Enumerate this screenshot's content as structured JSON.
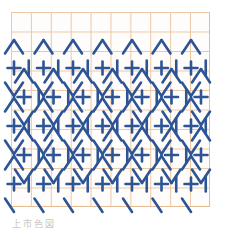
{
  "document": {
    "title": "Geometric Pattern Swatch",
    "background_color": "#ffffff"
  },
  "caption": {
    "text": "上市色図"
  },
  "grid": {
    "name": "graph-paper-grid",
    "line_color": "#e9bb93",
    "cell_width": 19.9,
    "cell_height": 19.5,
    "columns": 10,
    "rows": 10,
    "origin_x": 11,
    "origin_y": 12,
    "width": 199,
    "height": 195
  },
  "pattern": {
    "name": "hexagonal-cross-lattice",
    "stroke_color": "#2d5596",
    "stroke_width": 2.6,
    "motif_names": [
      "plus-sign",
      "vertical-bar",
      "diagonal-stroke"
    ],
    "cross_rows_y": [
      68,
      97,
      126,
      155,
      184
    ],
    "cross_row_offsets": [
      0,
      10,
      0,
      10,
      0
    ],
    "cross_spacing_x": 29.5,
    "cross_size": 13,
    "bar_height": 15,
    "diagonal_length": 19,
    "chevron_rows_y": [
      39,
      53,
      82,
      111,
      140,
      169,
      198
    ],
    "description": "Seamless lattice of plus signs enclosed by hexagon outlines formed from diagonal strokes and vertical bars, drawn over orange graph paper."
  },
  "chart_data": {
    "type": "heatmap",
    "xlabel": "",
    "ylabel": "",
    "grid": true,
    "categories": [
      "col1",
      "col2",
      "col3",
      "col4",
      "col5",
      "col6",
      "col7",
      "col8",
      "col9",
      "col10"
    ],
    "values": [
      5,
      5,
      5,
      5,
      5,
      5,
      5,
      5,
      5,
      5
    ]
  }
}
